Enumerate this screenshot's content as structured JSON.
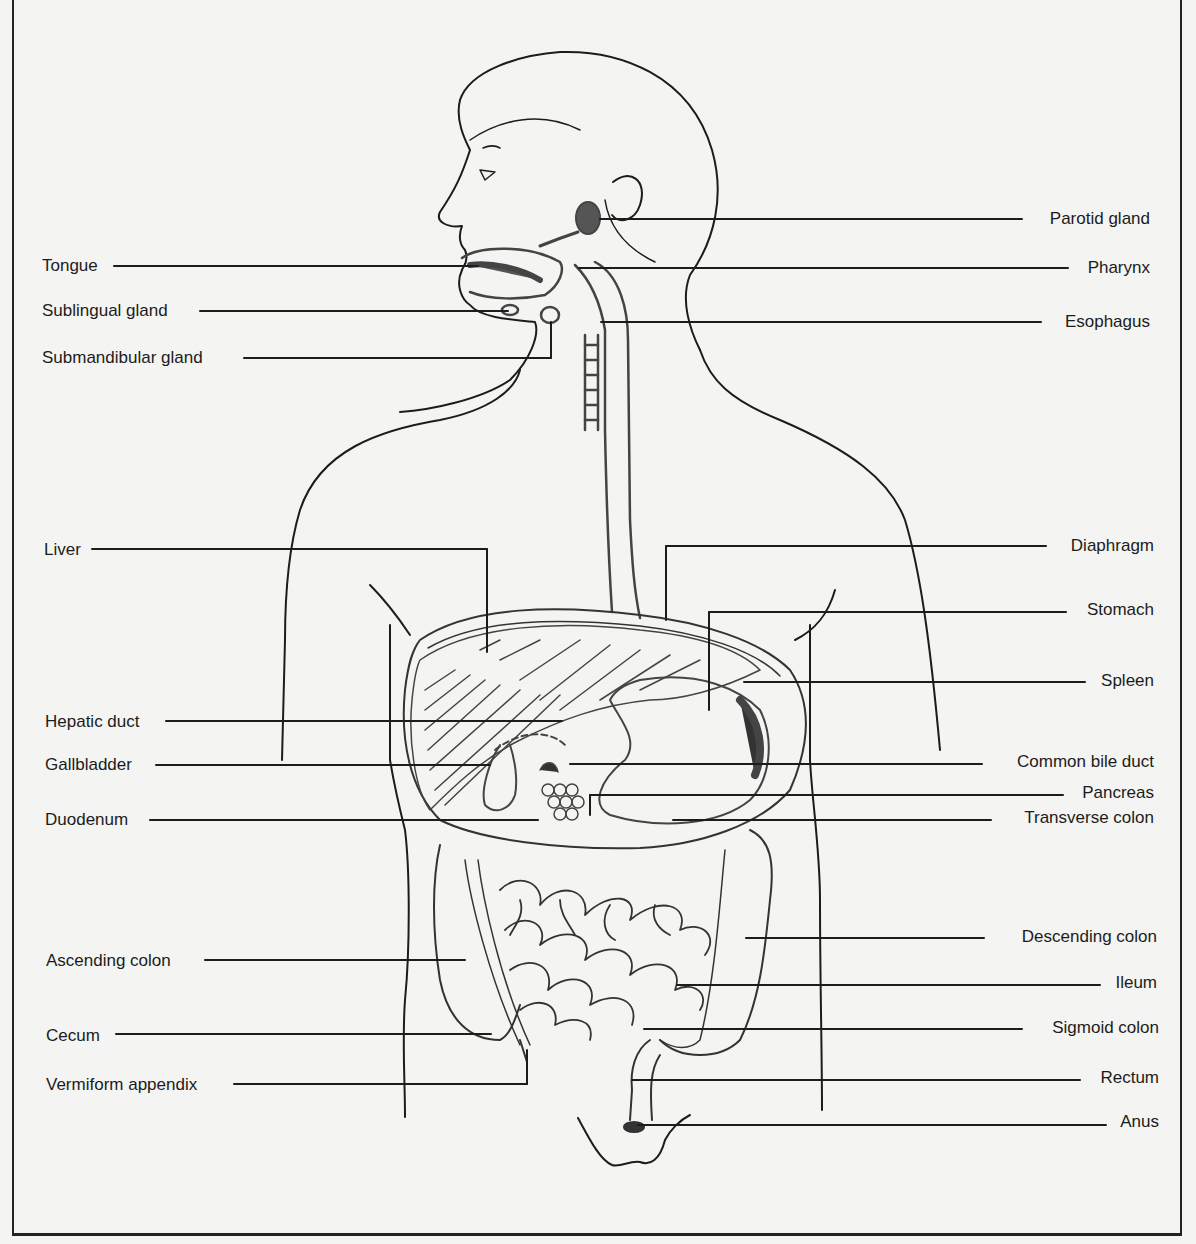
{
  "diagram": {
    "colors": {
      "ink": "#1c1c1c",
      "paper": "#f4f4f2",
      "organ_line": "#444444"
    },
    "labels_left": [
      {
        "id": "tongue",
        "text": "Tongue",
        "x": 42,
        "y": 256,
        "line_y": 266,
        "line_x1": 114,
        "line_x2": 478
      },
      {
        "id": "sublingual-gland",
        "text": "Sublingual gland",
        "x": 42,
        "y": 301,
        "line_y": 311,
        "line_x1": 200,
        "line_x2": 508
      },
      {
        "id": "submandibular-gland",
        "text": "Submandibular gland",
        "x": 42,
        "y": 348,
        "line_y": 358,
        "line_x1": 244,
        "line_x2": 551
      },
      {
        "id": "liver",
        "text": "Liver",
        "x": 44,
        "y": 540,
        "line_y": 549,
        "line_x1": 92,
        "line_x2": 487
      },
      {
        "id": "hepatic-duct",
        "text": "Hepatic duct",
        "x": 45,
        "y": 712,
        "line_y": 721,
        "line_x1": 166,
        "line_x2": 562
      },
      {
        "id": "gallbladder",
        "text": "Gallbladder",
        "x": 45,
        "y": 755,
        "line_y": 765,
        "line_x1": 156,
        "line_x2": 490
      },
      {
        "id": "duodenum",
        "text": "Duodenum",
        "x": 45,
        "y": 810,
        "line_y": 820,
        "line_x1": 150,
        "line_x2": 538
      },
      {
        "id": "ascending-colon",
        "text": "Ascending colon",
        "x": 46,
        "y": 951,
        "line_y": 960,
        "line_x1": 205,
        "line_x2": 465
      },
      {
        "id": "cecum",
        "text": "Cecum",
        "x": 46,
        "y": 1026,
        "line_y": 1034,
        "line_x1": 116,
        "line_x2": 491
      },
      {
        "id": "vermiform-appendix",
        "text": "Vermiform appendix",
        "x": 46,
        "y": 1075,
        "line_y": 1084,
        "line_x1": 234,
        "line_x2": 527
      }
    ],
    "labels_right": [
      {
        "id": "parotid-gland",
        "text": "Parotid gland",
        "right": 1150,
        "y": 209,
        "line_y": 219,
        "line_x1": 600,
        "line_x2": 1022
      },
      {
        "id": "pharynx",
        "text": "Pharynx",
        "right": 1150,
        "y": 258,
        "line_y": 268,
        "line_x1": 579,
        "line_x2": 1068
      },
      {
        "id": "esophagus",
        "text": "Esophagus",
        "right": 1150,
        "y": 312,
        "line_y": 322,
        "line_x1": 601,
        "line_x2": 1041
      },
      {
        "id": "diaphragm",
        "text": "Diaphragm",
        "right": 1154,
        "y": 536,
        "line_y": 546,
        "line_x1": 666,
        "line_x2": 1046
      },
      {
        "id": "stomach",
        "text": "Stomach",
        "right": 1154,
        "y": 600,
        "line_y": 612,
        "line_x1": 709,
        "line_x2": 1066
      },
      {
        "id": "spleen",
        "text": "Spleen",
        "right": 1154,
        "y": 671,
        "line_y": 682,
        "line_x1": 744,
        "line_x2": 1085
      },
      {
        "id": "common-bile-duct",
        "text": "Common bile duct",
        "right": 1154,
        "y": 752,
        "line_y": 764,
        "line_x1": 570,
        "line_x2": 982
      },
      {
        "id": "pancreas",
        "text": "Pancreas",
        "right": 1154,
        "y": 783,
        "line_y": 795,
        "line_x1": 590,
        "line_x2": 1063
      },
      {
        "id": "transverse-colon",
        "text": "Transverse colon",
        "right": 1154,
        "y": 808,
        "line_y": 820,
        "line_x1": 673,
        "line_x2": 991
      },
      {
        "id": "descending-colon",
        "text": "Descending colon",
        "right": 1157,
        "y": 927,
        "line_y": 938,
        "line_x1": 746,
        "line_x2": 984
      },
      {
        "id": "ileum",
        "text": "Ileum",
        "right": 1157,
        "y": 973,
        "line_y": 985,
        "line_x1": 677,
        "line_x2": 1100
      },
      {
        "id": "sigmoid-colon",
        "text": "Sigmoid colon",
        "right": 1159,
        "y": 1018,
        "line_y": 1029,
        "line_x1": 644,
        "line_x2": 1022
      },
      {
        "id": "rectum",
        "text": "Rectum",
        "right": 1159,
        "y": 1068,
        "line_y": 1080,
        "line_x1": 632,
        "line_x2": 1080
      },
      {
        "id": "anus",
        "text": "Anus",
        "right": 1159,
        "y": 1112,
        "line_y": 1125,
        "line_x1": 638,
        "line_x2": 1106
      }
    ]
  }
}
